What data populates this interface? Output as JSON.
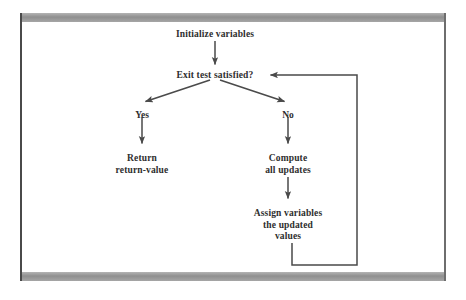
{
  "diagram": {
    "line_color": "#4a4a4a",
    "text_color": "#2e2e2e",
    "frame_color": "#9a9a9a",
    "nodes": [
      {
        "id": "initialize",
        "text": "Initialize variables",
        "x": 215,
        "y": 29
      },
      {
        "id": "exit-test",
        "text": "Exit test satisfied?",
        "x": 215,
        "y": 70
      },
      {
        "id": "return",
        "text": "Return\nreturn-value",
        "x": 142,
        "y": 153
      },
      {
        "id": "compute",
        "text": "Compute\nall updates",
        "x": 288,
        "y": 153
      },
      {
        "id": "assign",
        "text": "Assign variables\nthe updated\nvalues",
        "x": 288,
        "y": 208
      }
    ],
    "branch_labels": [
      {
        "id": "yes",
        "text": "Yes",
        "x": 142,
        "y": 110
      },
      {
        "id": "no",
        "text": "No",
        "x": 288,
        "y": 110
      }
    ],
    "edges": [
      {
        "id": "initialize-to-exit-test",
        "from": "initialize",
        "to": "exit-test",
        "kind": "vertical-arrow"
      },
      {
        "id": "exit-test-to-yes",
        "from": "exit-test",
        "to": "yes",
        "kind": "diagonal-arrow"
      },
      {
        "id": "exit-test-to-no",
        "from": "exit-test",
        "to": "no",
        "kind": "diagonal-arrow"
      },
      {
        "id": "yes-to-return",
        "from": "yes",
        "to": "return",
        "kind": "vertical-arrow"
      },
      {
        "id": "no-to-compute",
        "from": "no",
        "to": "compute",
        "kind": "vertical-arrow"
      },
      {
        "id": "compute-to-assign",
        "from": "compute",
        "to": "assign",
        "kind": "vertical-arrow"
      },
      {
        "id": "assign-to-exit-test",
        "from": "assign",
        "to": "exit-test",
        "kind": "feedback-loop"
      }
    ]
  }
}
